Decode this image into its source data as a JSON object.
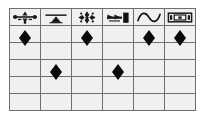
{
  "matrix": {
    "columns": [
      {
        "id": "col-1",
        "icon": "spread-bar-icon",
        "label": ""
      },
      {
        "id": "col-2",
        "icon": "triangle-on-bar-icon",
        "label": ""
      },
      {
        "id": "col-3",
        "icon": "four-point-star-cluster-icon",
        "label": ""
      },
      {
        "id": "col-4",
        "icon": "dark-block-marker-icon",
        "label": ""
      },
      {
        "id": "col-5",
        "icon": "sine-wave-icon",
        "label": ""
      },
      {
        "id": "col-6",
        "icon": "boxed-rectangle-icon",
        "label": ""
      }
    ],
    "marker_glyph": "diamond-marker",
    "rows": [
      {
        "id": "row-1",
        "cells": [
          true,
          false,
          true,
          false,
          true,
          true
        ]
      },
      {
        "id": "row-2",
        "cells": [
          false,
          false,
          false,
          false,
          false,
          false
        ]
      },
      {
        "id": "row-3",
        "cells": [
          false,
          true,
          false,
          true,
          false,
          false
        ]
      },
      {
        "id": "row-4",
        "cells": [
          false,
          false,
          false,
          false,
          false,
          false
        ]
      },
      {
        "id": "row-5",
        "cells": [
          false,
          false,
          false,
          false,
          false,
          false
        ]
      }
    ],
    "colors": {
      "grid_line": "#6e6e6e",
      "outer_border": "#8a8a8a",
      "marker": "#0a0a0a",
      "cell_background": "#f0f0f0",
      "header_background": "#ffffff",
      "band_background": "#e9e9e9",
      "page_background": "#ffffff"
    }
  }
}
